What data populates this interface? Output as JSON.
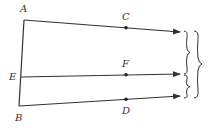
{
  "diagram": {
    "colors": {
      "line": "#333333",
      "background": "#ffffff"
    },
    "points": [
      {
        "id": "A",
        "label": "A",
        "x": 24,
        "y": 20,
        "lx": 20,
        "ly": 12
      },
      {
        "id": "E",
        "label": "E",
        "x": 21,
        "y": 77,
        "lx": 9,
        "ly": 80
      },
      {
        "id": "B",
        "label": "B",
        "x": 19,
        "y": 106,
        "lx": 15,
        "ly": 121
      },
      {
        "id": "C",
        "label": "C",
        "x": 126,
        "y": 27,
        "lx": 122,
        "ly": 20
      },
      {
        "id": "F",
        "label": "F",
        "x": 126,
        "y": 74,
        "lx": 122,
        "ly": 67
      },
      {
        "id": "D",
        "label": "D",
        "x": 126,
        "y": 99,
        "lx": 122,
        "ly": 114
      }
    ],
    "segments": [
      {
        "from": "A",
        "to": "B"
      }
    ],
    "rays": [
      {
        "from": "A",
        "through": "C",
        "end_x": 180,
        "end_y": 32
      },
      {
        "from": "E",
        "through": "F",
        "end_x": 180,
        "end_y": 74
      },
      {
        "from": "B",
        "through": "D",
        "end_x": 180,
        "end_y": 96
      }
    ],
    "braces": [
      {
        "name": "brace-upper",
        "x": 186,
        "y1": 31,
        "y2": 74
      },
      {
        "name": "brace-lower",
        "x": 186,
        "y1": 74,
        "y2": 98
      },
      {
        "name": "brace-outer",
        "x": 197,
        "y1": 31,
        "y2": 98
      }
    ]
  }
}
